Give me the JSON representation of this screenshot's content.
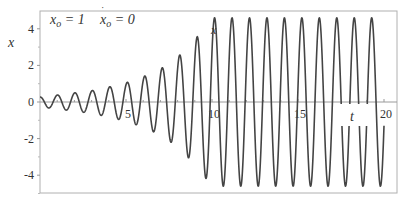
{
  "chart_data": {
    "type": "line",
    "title": "",
    "xlabel": "t",
    "ylabel": "x",
    "xlim": [
      0,
      20
    ],
    "ylim": [
      -5,
      5
    ],
    "x_ticks": [
      5,
      10,
      15,
      20
    ],
    "x_tick_labels": [
      "5",
      "10",
      "15",
      "20"
    ],
    "y_ticks": [
      -4,
      -2,
      0,
      2,
      4
    ],
    "y_tick_labels": [
      "-4",
      "-2",
      "0",
      "2",
      "4"
    ],
    "grid": false,
    "legend": null,
    "annotations": [
      {
        "text": "x₀ = 1",
        "position": "top-left"
      },
      {
        "text": "ẋ₀ = 0",
        "position": "top-left"
      },
      {
        "text": "x",
        "position": "near peak at t≈10"
      }
    ],
    "series": [
      {
        "name": "x(t)",
        "description": "growing oscillation (resonance-like) saturating near amplitude 4.6 after t≈10; period ≈ 1.0",
        "period": 1.015,
        "envelope": {
          "t": [
            0,
            1,
            2,
            3,
            4,
            5,
            6,
            7,
            8,
            9,
            10,
            11,
            12,
            13,
            14,
            15,
            16,
            17,
            18,
            19,
            20
          ],
          "amplitude": [
            0.27,
            0.38,
            0.5,
            0.62,
            0.82,
            1.05,
            1.38,
            1.8,
            2.45,
            3.4,
            4.6,
            4.6,
            4.6,
            4.6,
            4.6,
            4.6,
            4.6,
            4.6,
            4.6,
            4.6,
            4.6
          ]
        },
        "color": "#444444"
      }
    ]
  },
  "labels": {
    "x0": "x",
    "x0_sub": "o",
    "x0_val": " = 1",
    "xdot0": "x",
    "xdot0_sub": "o",
    "xdot0_val": " = 0",
    "curve_label": "x",
    "xlabel": "t",
    "ylabel": "x"
  },
  "colors": {
    "curve": "#444444",
    "axis": "#999999",
    "frame": "#aaaaaa",
    "text": "#333333"
  }
}
